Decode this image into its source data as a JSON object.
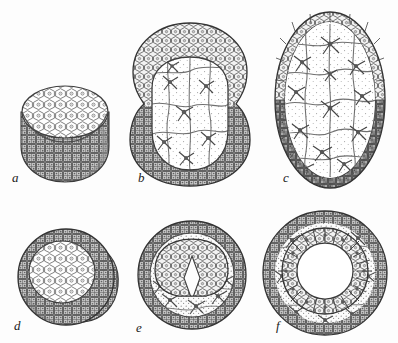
{
  "plate": {
    "title": "Stages of embryonic development (blastula to gastrula)",
    "background_color": "#fdfdfd",
    "ink_color": "#2b2b2b",
    "width": 398,
    "height": 343,
    "rows": 2,
    "columns": 3
  },
  "figures": [
    {
      "label": "a",
      "label_x": 12,
      "label_y": 182,
      "name": "figure-a-morula-disc",
      "caption": "Solid disc-shaped blastula with flattened upper cell plate",
      "center_x": 65,
      "center_y": 124,
      "radius_x": 44,
      "radius_y": 44,
      "shading": "dark-stipple-lower",
      "inner_fill": "#ffffff",
      "cell_type": "polygonal-epithelial"
    },
    {
      "label": "b",
      "label_x": 138,
      "label_y": 182,
      "name": "figure-b-gastrula-bilobed",
      "caption": "Bilobed embryo with thick outer epithelium and stellate inner mass",
      "center_x": 190,
      "center_y": 103,
      "radius_x": 57,
      "radius_y": 80,
      "shading": "light-above-dark-below",
      "inner_fill": "#fcfcfc",
      "cell_type": "stellate-mesenchyme"
    },
    {
      "label": "c",
      "label_x": 283,
      "label_y": 182,
      "name": "figure-c-elongated-embryo",
      "caption": "Elongated oval embryo with columnar epithelium and large vacuolated cells",
      "center_x": 330,
      "center_y": 100,
      "radius_x": 55,
      "radius_y": 88,
      "shading": "columnar-rim",
      "inner_fill": "#fcfcfc",
      "cell_type": "large-stellate"
    },
    {
      "label": "d",
      "label_x": 14,
      "label_y": 330,
      "name": "figure-d-blastula-cap",
      "caption": "Spherical embryo with pale cap of enlarged cells",
      "center_x": 66,
      "center_y": 277,
      "radius_x": 48,
      "radius_y": 48,
      "shading": "dense-stipple",
      "inner_fill": "#ffffff",
      "cell_type": "polygonal-epithelial"
    },
    {
      "label": "e",
      "label_x": 136,
      "label_y": 332,
      "name": "figure-e-inner-cell-mass",
      "caption": "Sphere with dark outer ring enclosing inner cell mass and cavity",
      "center_x": 192,
      "center_y": 275,
      "radius_x": 54,
      "radius_y": 54,
      "shading": "dark-ring",
      "inner_fill": "#fdfdfd",
      "cell_type": "polygonal-and-stellate"
    },
    {
      "label": "f",
      "label_x": 276,
      "label_y": 330,
      "name": "figure-f-vesicle-lumen",
      "caption": "Sphere with radial columnar inner vesicle surrounding a clear lumen",
      "center_x": 325,
      "center_y": 273,
      "radius_x": 62,
      "radius_y": 62,
      "shading": "dark-ring",
      "inner_fill": "#ffffff",
      "cell_type": "radial-columnar",
      "lumen_radius": 28
    }
  ]
}
